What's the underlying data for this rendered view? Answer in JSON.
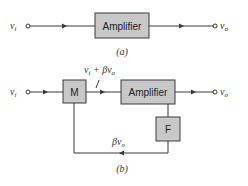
{
  "diagram_a": {
    "caption": "(a)",
    "input_label": "v",
    "input_sub": "i",
    "output_label": "v",
    "output_sub": "o",
    "amplifier_label": "Amplifier"
  },
  "diagram_b": {
    "caption": "(b)",
    "input_label": "v",
    "input_sub": "i",
    "output_label": "v",
    "output_sub": "o",
    "mixer_label": "M",
    "amplifier_label": "Amplifier",
    "feedback_label": "F",
    "sum_signal": {
      "v1": "v",
      "s1": "i",
      "plus": " + βv",
      "s2": "o"
    },
    "feedback_signal": {
      "prefix": "βv",
      "sub": "o"
    }
  },
  "colors": {
    "box_fill": "#c8c8c8",
    "line": "#3a3a3a",
    "background": "#ffffff"
  }
}
